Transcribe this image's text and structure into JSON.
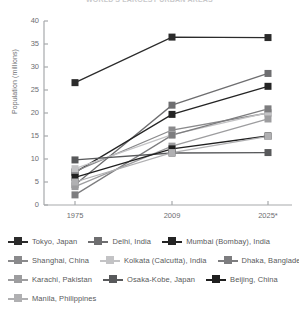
{
  "chart_data": {
    "type": "line",
    "title": "WORLD'S LARGEST URBAN AREAS",
    "xlabel": "",
    "ylabel": "Population (millions)",
    "categories": [
      "1975",
      "2009",
      "2025*"
    ],
    "x_ticks": [
      "1975",
      "2009",
      "2025*"
    ],
    "y_ticks": [
      "0",
      "5",
      "10",
      "15",
      "20",
      "25",
      "30",
      "35",
      "40"
    ],
    "ylim": [
      0,
      40
    ],
    "grid": false,
    "legend_position": "bottom",
    "marker": "square",
    "series": [
      {
        "name": "Tokyo, Japan",
        "color": "#2b2b2b",
        "values": [
          26.6,
          36.5,
          36.4
        ]
      },
      {
        "name": "Delhi, India",
        "color": "#6e6e70",
        "values": [
          4.4,
          21.7,
          28.6
        ]
      },
      {
        "name": "Mumbai (Bombay), India",
        "color": "#242424",
        "values": [
          7.1,
          19.7,
          25.8
        ]
      },
      {
        "name": "Shanghai, China",
        "color": "#8a8a8c",
        "values": [
          7.3,
          16.3,
          20.0
        ]
      },
      {
        "name": "Kolkata (Calcutta), India",
        "color": "#c3c3c5",
        "values": [
          7.9,
          15.3,
          20.1
        ]
      },
      {
        "name": "Dhaka, Bangladesh",
        "color": "#7d7d7f",
        "values": [
          2.2,
          15.2,
          20.9
        ]
      },
      {
        "name": "Karachi, Pakistan",
        "color": "#9d9d9f",
        "values": [
          4.0,
          12.8,
          18.7
        ]
      },
      {
        "name": "Osaka-Kobe, Japan",
        "color": "#58595b",
        "values": [
          9.8,
          11.3,
          11.4
        ]
      },
      {
        "name": "Beijing, China",
        "color": "#1f1f1f",
        "values": [
          6.0,
          12.2,
          15.0
        ]
      },
      {
        "name": "Manila, Philippines",
        "color": "#b0b0b2",
        "values": [
          5.0,
          11.4,
          14.9
        ]
      }
    ]
  },
  "legend": {
    "rows": [
      [
        {
          "label": "Tokyo, Japan",
          "color": "#2b2b2b"
        },
        {
          "label": "Delhi, India",
          "color": "#6e6e70"
        },
        {
          "label": "Mumbai (Bombay), India",
          "color": "#242424"
        }
      ],
      [
        {
          "label": "Shanghai, China",
          "color": "#8a8a8c"
        },
        {
          "label": "Kolkata (Calcutta), India",
          "color": "#c3c3c5"
        },
        {
          "label": "Dhaka, Bangladesh",
          "color": "#7d7d7f"
        }
      ],
      [
        {
          "label": "Karachi, Pakistan",
          "color": "#9d9d9f"
        },
        {
          "label": "Osaka-Kobe, Japan",
          "color": "#58595b"
        },
        {
          "label": "Beijing, China",
          "color": "#1f1f1f"
        }
      ],
      [
        {
          "label": "Manila, Philippines",
          "color": "#b0b0b2"
        }
      ]
    ]
  },
  "axis": {
    "y_title": "Population (millions)",
    "axis_color": "#a7a9ac",
    "text_color": "#6d6e71"
  }
}
